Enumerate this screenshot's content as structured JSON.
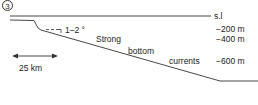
{
  "panel": {
    "number": "3"
  },
  "labels": {
    "sea_level": "s.l",
    "depth_200": "−200 m",
    "depth_400": "−400 m",
    "depth_600": "−600 m",
    "slope_angle": "1–2 °",
    "process_line1": "Strong",
    "process_line2": "bottom",
    "process_line3": "currents",
    "scale_bar": "25 km"
  },
  "colors": {
    "line": "#333333",
    "text": "#222222",
    "background": "#ffffff"
  }
}
